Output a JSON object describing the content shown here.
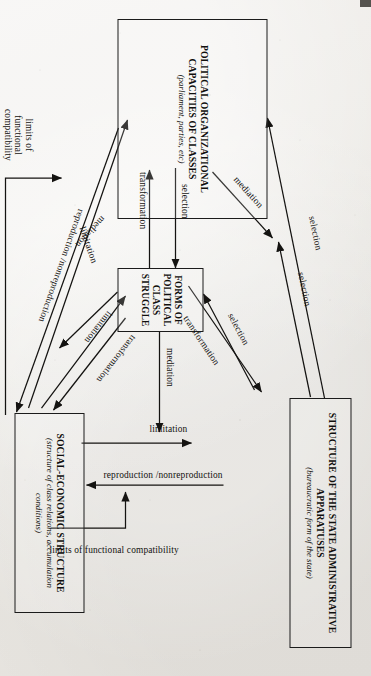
{
  "figure": {
    "orientation": "rotated-90-clockwise",
    "ink_color": "#141311",
    "paper_color": "#eceae6"
  },
  "nodes": [
    {
      "id": "state-apparatuses",
      "title": "STRUCTURE OF THE STATE ADMINISTRATIVE APPARATUSES",
      "subtitle": "(bureaucratic form of the state)"
    },
    {
      "id": "political-capacities",
      "title": "POLITICAL ORGANIZATIONAL CAPACITIES OF CLASSES",
      "subtitle": "(parliament, parties, etc)"
    },
    {
      "id": "class-struggle",
      "title": "FORMS OF POLITICAL CLASS STRUGGLE",
      "subtitle": ""
    },
    {
      "id": "social-economic",
      "title": "SOCIAL-ECONOMIC STRUCTURE",
      "subtitle": "(structure of class relations, accumulation conditions)"
    }
  ],
  "edges": [
    {
      "id": "e1",
      "label": "selection",
      "from": "state-apparatuses",
      "to": "political-capacities"
    },
    {
      "id": "e2",
      "label": "selection",
      "from": "state-apparatuses",
      "to": "class-struggle"
    },
    {
      "id": "e3",
      "label": "mediation",
      "from": "political-capacities",
      "to": "class-struggle"
    },
    {
      "id": "e4",
      "label": "selection",
      "from": "class-struggle",
      "to": "state-apparatuses"
    },
    {
      "id": "e5",
      "label": "transformation",
      "from": "class-struggle",
      "to": "state-apparatuses"
    },
    {
      "id": "e6",
      "label": "selection",
      "from": "political-capacities",
      "to": "class-struggle"
    },
    {
      "id": "e7",
      "label": "transformation",
      "from": "class-struggle",
      "to": "political-capacities"
    },
    {
      "id": "e8",
      "label": "mediation",
      "from": "class-struggle",
      "to": "state-apparatuses"
    },
    {
      "id": "e9",
      "label": "limitation",
      "from": "social-economic",
      "to": "state-apparatuses"
    },
    {
      "id": "e10",
      "label": "reproduction /nonreproduction",
      "from": "state-apparatuses",
      "to": "social-economic"
    },
    {
      "id": "e11",
      "label": "limits of functional compatibility",
      "from": "social-economic",
      "to": "state-apparatuses"
    },
    {
      "id": "e12",
      "label": "mediation",
      "from": "class-struggle",
      "to": "social-economic"
    },
    {
      "id": "e13",
      "label": "limitation",
      "from": "social-economic",
      "to": "class-struggle"
    },
    {
      "id": "e14",
      "label": "transformation",
      "from": "class-struggle",
      "to": "social-economic"
    },
    {
      "id": "e15",
      "label": "limitation",
      "from": "social-economic",
      "to": "political-capacities"
    },
    {
      "id": "e16",
      "label": "reproduction /nonreproduction",
      "from": "political-capacities",
      "to": "social-economic"
    },
    {
      "id": "e17",
      "label": "limits of functional compatibility",
      "from": "social-economic",
      "to": "political-capacities"
    }
  ],
  "labels": {
    "selection_top_outer": "selection",
    "selection_top_inner": "selection",
    "mediation_upper_left": "mediation",
    "selection_upper_right": "selection",
    "transformation_upper_right": "transformation",
    "selection_mid": "selection",
    "transformation_mid": "transformation",
    "mediation_mid": "mediation",
    "limitation_right": "limitation",
    "reproduction_right": "reproduction /nonreproduction",
    "compat_right": "limits of functional compatibility",
    "mediation_lower_left": "mediation",
    "limitation_lower_mid": "limitation",
    "transformation_lower_right": "transformation",
    "limitation_lower_long": "limitation",
    "reproduction_lower_long": "reproduction /nonreproduction",
    "compat_lower": "limits of functional compatibility"
  }
}
